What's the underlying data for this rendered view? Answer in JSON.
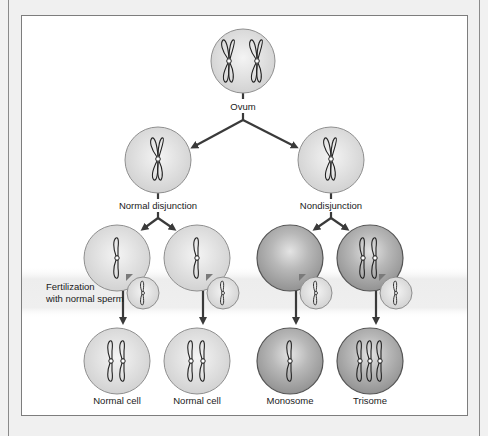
{
  "diagram": {
    "title_clipped": "",
    "nodes": {
      "ovum": {
        "label": "Ovum",
        "chromosomes": 2
      },
      "normal_disjunction": {
        "label": "Normal disjunction",
        "chromosomes": 1
      },
      "nondisjunction": {
        "label": "Nondisjunction",
        "chromosomes": 1
      },
      "gamete_normal_1": {
        "label": "",
        "chromosomes": 1
      },
      "gamete_normal_2": {
        "label": "",
        "chromosomes": 1
      },
      "gamete_empty": {
        "label": "",
        "chromosomes": 0
      },
      "gamete_double": {
        "label": "",
        "chromosomes": 2
      },
      "result_normal_1": {
        "label": "Normal cell",
        "chromosomes": 2
      },
      "result_normal_2": {
        "label": "Normal cell",
        "chromosomes": 2
      },
      "result_monosome": {
        "label": "Monosome",
        "chromosomes": 1
      },
      "result_trisome": {
        "label": "Trisome",
        "chromosomes": 3
      }
    },
    "fertilization_label_line1": "Fertilization",
    "fertilization_label_line2": "with normal sperm",
    "colors": {
      "cell_light": "#d9d9d9",
      "cell_dark": "#a8a8a8",
      "arrow": "#3a3a3a",
      "band": "#ececec"
    }
  }
}
